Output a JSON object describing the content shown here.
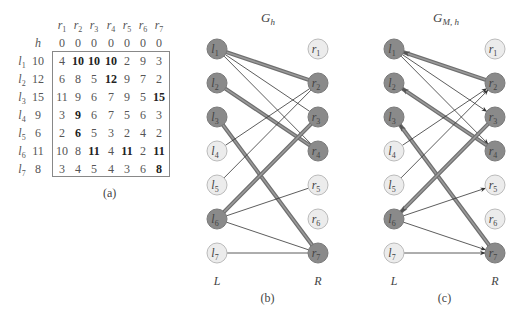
{
  "table": {
    "caption": "(a)",
    "h_label": "h",
    "col_headers": [
      "r1",
      "r2",
      "r3",
      "r4",
      "r5",
      "r6",
      "r7"
    ],
    "h_values": [
      "0",
      "0",
      "0",
      "0",
      "0",
      "0",
      "0"
    ],
    "rows": [
      {
        "label": "l1",
        "h": "10",
        "cells": [
          "4",
          "10",
          "10",
          "10",
          "2",
          "9",
          "3"
        ],
        "bold": [
          1,
          2,
          3
        ]
      },
      {
        "label": "l2",
        "h": "12",
        "cells": [
          "6",
          "8",
          "5",
          "12",
          "9",
          "7",
          "2"
        ],
        "bold": [
          3
        ]
      },
      {
        "label": "l3",
        "h": "15",
        "cells": [
          "11",
          "9",
          "6",
          "7",
          "9",
          "5",
          "15"
        ],
        "bold": [
          6
        ]
      },
      {
        "label": "l4",
        "h": "9",
        "cells": [
          "3",
          "9",
          "6",
          "7",
          "5",
          "6",
          "3"
        ],
        "bold": [
          1
        ]
      },
      {
        "label": "l5",
        "h": "6",
        "cells": [
          "2",
          "6",
          "5",
          "3",
          "2",
          "4",
          "2"
        ],
        "bold": [
          1
        ]
      },
      {
        "label": "l6",
        "h": "11",
        "cells": [
          "10",
          "8",
          "11",
          "4",
          "11",
          "2",
          "11"
        ],
        "bold": [
          2,
          4,
          6
        ]
      },
      {
        "label": "l7",
        "h": "8",
        "cells": [
          "3",
          "4",
          "5",
          "4",
          "3",
          "6",
          "8"
        ],
        "bold": [
          6
        ]
      }
    ]
  },
  "graph_b": {
    "title": "G_h",
    "caption": "(b)",
    "left_label": "L",
    "right_label": "R",
    "left_nodes": [
      {
        "id": "l1",
        "dark": true
      },
      {
        "id": "l2",
        "dark": true
      },
      {
        "id": "l3",
        "dark": true
      },
      {
        "id": "l4",
        "dark": false
      },
      {
        "id": "l5",
        "dark": false
      },
      {
        "id": "l6",
        "dark": true
      },
      {
        "id": "l7",
        "dark": false
      }
    ],
    "right_nodes": [
      {
        "id": "r1",
        "dark": false
      },
      {
        "id": "r2",
        "dark": true
      },
      {
        "id": "r3",
        "dark": true
      },
      {
        "id": "r4",
        "dark": true
      },
      {
        "id": "r5",
        "dark": false
      },
      {
        "id": "r6",
        "dark": false
      },
      {
        "id": "r7",
        "dark": true
      }
    ],
    "edges": [
      {
        "from": "l1",
        "to": "r2",
        "matched": true
      },
      {
        "from": "l1",
        "to": "r3",
        "matched": false
      },
      {
        "from": "l1",
        "to": "r4",
        "matched": false
      },
      {
        "from": "l2",
        "to": "r4",
        "matched": true
      },
      {
        "from": "l3",
        "to": "r7",
        "matched": true
      },
      {
        "from": "l4",
        "to": "r2",
        "matched": false
      },
      {
        "from": "l5",
        "to": "r2",
        "matched": false
      },
      {
        "from": "l6",
        "to": "r3",
        "matched": true
      },
      {
        "from": "l6",
        "to": "r5",
        "matched": false
      },
      {
        "from": "l6",
        "to": "r7",
        "matched": false
      },
      {
        "from": "l7",
        "to": "r7",
        "matched": false
      }
    ]
  },
  "graph_c": {
    "title": "G_M,h",
    "caption": "(c)",
    "left_label": "L",
    "right_label": "R",
    "arcs": [
      {
        "from": "r2",
        "to": "l1",
        "matched": true
      },
      {
        "from": "l1",
        "to": "r3",
        "matched": false
      },
      {
        "from": "l1",
        "to": "r4",
        "matched": false
      },
      {
        "from": "r4",
        "to": "l2",
        "matched": true
      },
      {
        "from": "r7",
        "to": "l3",
        "matched": true
      },
      {
        "from": "l4",
        "to": "r2",
        "matched": false
      },
      {
        "from": "l5",
        "to": "r2",
        "matched": false
      },
      {
        "from": "r3",
        "to": "l6",
        "matched": true
      },
      {
        "from": "l6",
        "to": "r5",
        "matched": false
      },
      {
        "from": "l6",
        "to": "r7",
        "matched": false
      },
      {
        "from": "l7",
        "to": "r7",
        "matched": false
      }
    ]
  },
  "colors": {
    "dark_node": "#8a8a8a",
    "light_node": "#ececec",
    "matched_edge": "#777777",
    "thin_edge": "#333333"
  }
}
